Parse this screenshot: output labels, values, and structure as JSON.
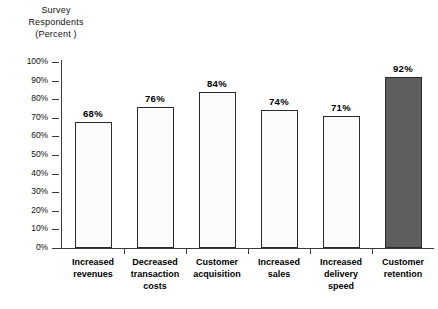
{
  "chart_data": {
    "type": "bar",
    "title": "",
    "ylabel": "Survey Respondents (Percent)",
    "xlabel": "",
    "ylim": [
      0,
      100
    ],
    "grid": false,
    "legend": "none",
    "categories": [
      "Increased revenues",
      "Decreased transaction costs",
      "Customer acquisition",
      "Increased sales",
      "Increased delivery speed",
      "Customer retention"
    ],
    "values": [
      68,
      76,
      84,
      74,
      71,
      92
    ],
    "value_labels": [
      "68%",
      "76%",
      "84%",
      "74%",
      "71%",
      "92%"
    ],
    "ytick_labels": [
      "0%",
      "10%",
      "20%",
      "30%",
      "40%",
      "50%",
      "60%",
      "70%",
      "80%",
      "90%",
      "100%"
    ],
    "ytick_values": [
      0,
      10,
      20,
      30,
      40,
      50,
      60,
      70,
      80,
      90,
      100
    ],
    "bar_colors": [
      "#fbfbfb",
      "#fbfbfb",
      "#fbfbfb",
      "#fbfbfb",
      "#fbfbfb",
      "#5e5e5e"
    ],
    "bar_border_color": "#2b2b2b",
    "highlight_index": 5,
    "background": "#ffffff"
  },
  "axis_title": {
    "line1": "Survey",
    "line2": "Respondents",
    "line3": "(Percent )"
  },
  "category_label_lines": [
    [
      "Increased",
      "revenues"
    ],
    [
      "Decreased",
      "transaction",
      "costs"
    ],
    [
      "Customer",
      "acquisition"
    ],
    [
      "Increased",
      "sales"
    ],
    [
      "Increased",
      "delivery",
      "speed"
    ],
    [
      "Customer",
      "retention"
    ]
  ]
}
